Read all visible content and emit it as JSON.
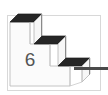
{
  "figure": {
    "label": "6",
    "frame": {
      "stroke_color": "#d8d8d8",
      "fill_color": "#ffffff",
      "visible": true
    },
    "colors": {
      "tread_dark": "#262626",
      "riser_light": "#f7f7f7",
      "front_face": "#fbfbfb",
      "outline": "#b9b9b9",
      "side_shade": "#8a8a8a",
      "connector": "#4a4a4a",
      "label_text": "#555555",
      "background": "#ffffff"
    },
    "steps": [
      {
        "index": 1,
        "name": "top-step"
      },
      {
        "index": 2,
        "name": "middle-step"
      },
      {
        "index": 3,
        "name": "bottom-step"
      }
    ],
    "connector": {
      "name": "arrow-line",
      "direction": "right",
      "visible": true
    }
  }
}
